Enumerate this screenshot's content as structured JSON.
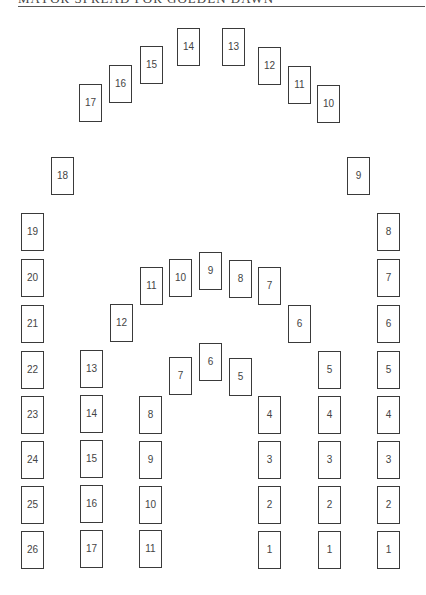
{
  "header": {
    "title": "MAYOR SPREAD FOR GOLDEN DAWN"
  },
  "spread": {
    "upper_arch": [
      {
        "label": "17",
        "x": 79,
        "y": 84
      },
      {
        "label": "16",
        "x": 109,
        "y": 65
      },
      {
        "label": "15",
        "x": 140,
        "y": 46
      },
      {
        "label": "14",
        "x": 177,
        "y": 28
      },
      {
        "label": "13",
        "x": 222,
        "y": 28
      },
      {
        "label": "12",
        "x": 258,
        "y": 47
      },
      {
        "label": "11",
        "x": 288,
        "y": 66
      },
      {
        "label": "10",
        "x": 317,
        "y": 85
      }
    ],
    "outer_left": [
      {
        "label": "18",
        "x": 51,
        "y": 157
      },
      {
        "label": "19",
        "x": 21,
        "y": 213
      },
      {
        "label": "20",
        "x": 21,
        "y": 259
      },
      {
        "label": "21",
        "x": 21,
        "y": 305
      },
      {
        "label": "22",
        "x": 21,
        "y": 351
      },
      {
        "label": "23",
        "x": 21,
        "y": 396
      },
      {
        "label": "24",
        "x": 21,
        "y": 441
      },
      {
        "label": "25",
        "x": 21,
        "y": 486
      },
      {
        "label": "26",
        "x": 21,
        "y": 531
      }
    ],
    "outer_right": [
      {
        "label": "9",
        "x": 347,
        "y": 157
      },
      {
        "label": "8",
        "x": 377,
        "y": 213
      },
      {
        "label": "7",
        "x": 377,
        "y": 259
      },
      {
        "label": "6",
        "x": 377,
        "y": 305
      },
      {
        "label": "5",
        "x": 377,
        "y": 351
      },
      {
        "label": "4",
        "x": 377,
        "y": 396
      },
      {
        "label": "3",
        "x": 377,
        "y": 441
      },
      {
        "label": "2",
        "x": 377,
        "y": 486
      },
      {
        "label": "1",
        "x": 377,
        "y": 531
      }
    ],
    "middle_arch": [
      {
        "label": "13",
        "x": 80,
        "y": 350
      },
      {
        "label": "14",
        "x": 80,
        "y": 395
      },
      {
        "label": "15",
        "x": 80,
        "y": 440
      },
      {
        "label": "16",
        "x": 80,
        "y": 485
      },
      {
        "label": "17",
        "x": 80,
        "y": 530
      },
      {
        "label": "12",
        "x": 110,
        "y": 304
      },
      {
        "label": "11",
        "x": 140,
        "y": 267
      },
      {
        "label": "10",
        "x": 169,
        "y": 259
      },
      {
        "label": "9",
        "x": 199,
        "y": 252
      },
      {
        "label": "8",
        "x": 229,
        "y": 260
      },
      {
        "label": "7",
        "x": 258,
        "y": 267
      },
      {
        "label": "6",
        "x": 288,
        "y": 305
      },
      {
        "label": "5",
        "x": 318,
        "y": 351
      },
      {
        "label": "4",
        "x": 318,
        "y": 396
      },
      {
        "label": "3",
        "x": 318,
        "y": 441
      },
      {
        "label": "2",
        "x": 318,
        "y": 486
      },
      {
        "label": "1",
        "x": 318,
        "y": 531
      }
    ],
    "inner_arch": [
      {
        "label": "8",
        "x": 139,
        "y": 396
      },
      {
        "label": "9",
        "x": 139,
        "y": 441
      },
      {
        "label": "10",
        "x": 139,
        "y": 486
      },
      {
        "label": "11",
        "x": 139,
        "y": 530
      },
      {
        "label": "7",
        "x": 169,
        "y": 357
      },
      {
        "label": "6",
        "x": 199,
        "y": 343
      },
      {
        "label": "5",
        "x": 229,
        "y": 358
      },
      {
        "label": "4",
        "x": 258,
        "y": 396
      },
      {
        "label": "3",
        "x": 258,
        "y": 441
      },
      {
        "label": "2",
        "x": 258,
        "y": 486
      },
      {
        "label": "1",
        "x": 258,
        "y": 531
      }
    ]
  },
  "colors": {
    "card_border": "#3a3a3a",
    "card_text": "#444444",
    "rule": "#555555"
  }
}
